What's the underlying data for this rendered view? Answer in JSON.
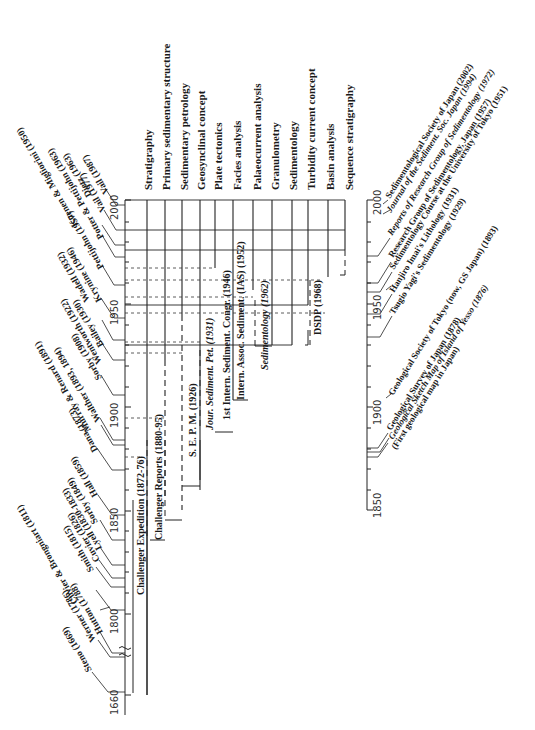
{
  "diagram": {
    "type": "timeline",
    "orientation": "rotated 90° (time runs bottom→top)",
    "main_axis": {
      "ticks": [
        "1660",
        "1800",
        "1850",
        "1900",
        "1950",
        "2000"
      ]
    },
    "japan_axis": {
      "ticks": [
        "1850",
        "1900",
        "1950",
        "2000"
      ]
    },
    "fields": [
      "Stratigraphy",
      "Primary sedimentary structure",
      "Sedimentary petrology",
      "Geosynclinal concept",
      "Plate tectonics",
      "Facies analysis",
      "Palaeocurrent analysis",
      "Granulometry",
      "Sedimentology",
      "Turbidity current concept",
      "Basin analysis",
      "Sequence stratigraphy"
    ],
    "events": [
      "Challenger Expedition (1872-76)",
      "Challenger Reports (1880-95)",
      "S. E. P. M. (1926)",
      "Jour. Sediment. Pet. (1931)",
      "1st Intern. Sediment. Congr. (1946)",
      "Intern. Assoc. Sediment. (IAS) (1952)",
      "Sedimentology (1962)",
      "DSDP (1968)"
    ],
    "authors": [
      "Steno (1669)",
      "Werner (1786)",
      "Hutton (1788)",
      "Cuvier & Brongniart (1811)",
      "Smith (1815)",
      "Cuvier (1826)",
      "Lyell (1830-1833)",
      "Sorby (1849)",
      "Hall (1859)",
      "Dana (1873)",
      "Murray & Renard (1891)",
      "Walther (1893, 1894)",
      "Sorby (1908)",
      "Wentworth (1922)",
      "Bailey (1930)",
      "Krynine (1946)",
      "Wadell (1932)",
      "Pettijohn (1957)",
      "Kuenen & Migliorini (1950)",
      "Potter & Pettijohn (1963)",
      "Vail (1977)",
      "Dietz (1963)",
      "Vail (1987)"
    ],
    "japan_events": [
      "Sedimentological Society of Japan (2002)",
      "Journal of the Sediment. Soc. Japan (1994)",
      "Reports of Research Group of Sedimentology (1972)",
      "Research Group of Sedimentology, Japan (1957)",
      "Sedimentology Course at the University of Tokyo (1951)",
      "Hanjiro Imai's Lithology (1931)",
      "Tsugio Yagi's Sedimentology (1929)",
      "Geological Society of Tokyo (now, GS Japan) (1893)",
      "Geological Survey of Japan (1878)",
      "Geological Sketch Map of Island of Yesso (1876)",
      "(First geological map in Japan)"
    ]
  }
}
